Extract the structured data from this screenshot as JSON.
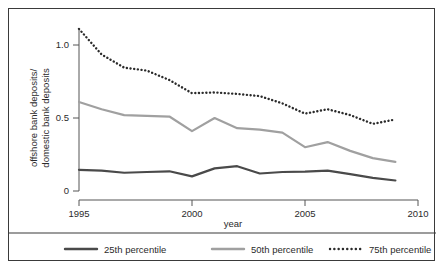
{
  "chart_data": {
    "type": "line",
    "title": "",
    "xlabel": "year",
    "ylabel": "offshore bank deposits/ domestic bank deposits",
    "ylabel_line1": "offshore bank deposits/",
    "ylabel_line2": "domestic bank deposits",
    "x": [
      1995,
      1996,
      1997,
      1998,
      1999,
      2000,
      2001,
      2002,
      2003,
      2004,
      2005,
      2006,
      2007,
      2008,
      2009
    ],
    "xlim": [
      1995,
      2010
    ],
    "ylim": [
      0,
      1.15
    ],
    "xticks": [
      1995,
      2000,
      2005,
      2010
    ],
    "xticklabels": [
      "1995",
      "2000",
      "2005",
      "2010"
    ],
    "yticks": [
      0,
      0.5,
      1.0
    ],
    "yticklabels": [
      "0",
      "0.5",
      "1.0"
    ],
    "grid": false,
    "legend_position": "bottom",
    "series": [
      {
        "name": "25th percentile",
        "style": "solid",
        "color": "#4a4a4a",
        "width": 2.2,
        "values": [
          0.145,
          0.14,
          0.125,
          0.13,
          0.135,
          0.1,
          0.155,
          0.17,
          0.12,
          0.13,
          0.133,
          0.14,
          0.115,
          0.09,
          0.072
        ]
      },
      {
        "name": "50th percentile",
        "style": "solid",
        "color": "#a0a0a0",
        "width": 2.2,
        "values": [
          0.61,
          0.56,
          0.52,
          0.515,
          0.51,
          0.41,
          0.5,
          0.43,
          0.42,
          0.4,
          0.3,
          0.335,
          0.275,
          0.225,
          0.2
        ]
      },
      {
        "name": "75th percentile",
        "style": "dotted",
        "color": "#2b2b2b",
        "width": 2.2,
        "values": [
          1.11,
          0.935,
          0.845,
          0.825,
          0.76,
          0.67,
          0.675,
          0.665,
          0.65,
          0.6,
          0.53,
          0.56,
          0.52,
          0.46,
          0.49
        ]
      }
    ]
  },
  "legend": {
    "items": [
      {
        "label": "25th percentile",
        "swatch": "solid-dark"
      },
      {
        "label": "50th percentile",
        "swatch": "solid-gray"
      },
      {
        "label": "75th percentile",
        "swatch": "dotted-dark"
      }
    ]
  },
  "colors": {
    "p25": "#4a4a4a",
    "p50": "#a0a0a0",
    "p75": "#2b2b2b",
    "axis": "#555555",
    "frame": "#3a3a3a",
    "text": "#2b2b2b",
    "background": "#ffffff"
  }
}
